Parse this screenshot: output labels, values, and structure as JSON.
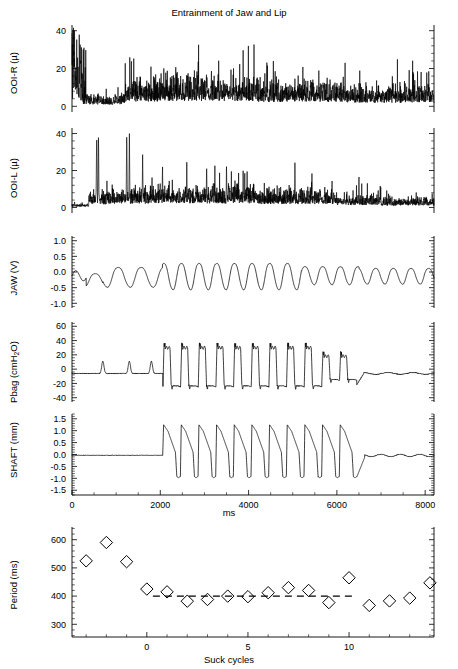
{
  "figure": {
    "title": "Entrainment of Jaw and Lip",
    "width": 458,
    "height": 669,
    "background": "#ffffff",
    "ink_color": "#000000"
  },
  "panels": [
    {
      "key": "ooi_r",
      "ylabel": "OOI-R (",
      "ylabel_unit": "µ",
      "ylabel_close": ")",
      "ylabel_full": "OOI-R (µ)",
      "yticks": [
        "0",
        "20",
        "40"
      ],
      "ytick_values": [
        0,
        20,
        40
      ],
      "ylim": [
        -3,
        43
      ],
      "xlim": [
        0,
        8200
      ]
    },
    {
      "key": "ooi_l",
      "ylabel_full": "OOI-L (µ)",
      "yticks": [
        "0",
        "20",
        "40"
      ],
      "ytick_values": [
        0,
        20,
        40
      ],
      "ylim": [
        -3,
        43
      ],
      "xlim": [
        0,
        8200
      ]
    },
    {
      "key": "jaw",
      "ylabel_full": "JAW (V)",
      "yticks": [
        "-1.0",
        "-0.5",
        "0.0",
        "0.5",
        "1.0"
      ],
      "ytick_values": [
        -1.0,
        -0.5,
        0.0,
        0.5,
        1.0
      ],
      "ylim": [
        -1.15,
        1.15
      ],
      "xlim": [
        0,
        8200
      ]
    },
    {
      "key": "pbag",
      "ylabel_full": "Pbag (cmH2O)",
      "ylabel_pre": "Pbag (cmH",
      "ylabel_sub": "2",
      "ylabel_post": "O)",
      "yticks": [
        "-40",
        "-20",
        "0",
        "20",
        "40",
        "60"
      ],
      "ytick_values": [
        -40,
        -20,
        0,
        20,
        40,
        60
      ],
      "ylim": [
        -46,
        66
      ],
      "xlim": [
        0,
        8200
      ]
    },
    {
      "key": "shaft",
      "ylabel_full": "SHAFT (mm)",
      "yticks": [
        "-1.5",
        "-1.0",
        "-0.5",
        "0.0",
        "0.5",
        "1.0",
        "1.5"
      ],
      "ytick_values": [
        -1.5,
        -1.0,
        -0.5,
        0.0,
        0.5,
        1.0,
        1.5
      ],
      "ylim": [
        -1.7,
        1.7
      ],
      "xlim": [
        0,
        8200
      ],
      "xlabel": "ms",
      "xticks": [
        "0",
        "2000",
        "4000",
        "6000",
        "8000"
      ],
      "xtick_values": [
        0,
        2000,
        4000,
        6000,
        8000
      ]
    },
    {
      "key": "period",
      "ylabel_full": "Period (ms)",
      "yticks": [
        "300",
        "400",
        "500",
        "600"
      ],
      "ytick_values": [
        300,
        400,
        500,
        600
      ],
      "ylim": [
        255,
        645
      ],
      "xlabel": "Suck cycles",
      "xticks": [
        "0",
        "5",
        "10"
      ],
      "xtick_values": [
        0,
        5,
        10
      ],
      "xlim": [
        -3.7,
        14.2
      ]
    }
  ],
  "chart_data": [
    {
      "type": "line",
      "name": "OOI-R",
      "title": "Entrainment of Jaw and Lip",
      "xlabel": "ms",
      "ylabel": "OOI-R (µ)",
      "xlim": [
        0,
        8200
      ],
      "ylim": [
        -3,
        43
      ],
      "yticks": [
        0,
        20,
        40
      ],
      "description": "Rectified EMG envelope of right orbicularis oris, noisy burst activity with large spikes to 40 at onset then sustained 5-25 activity",
      "grid": false
    },
    {
      "type": "line",
      "name": "OOI-L",
      "xlabel": "ms",
      "ylabel": "OOI-L (µ)",
      "xlim": [
        0,
        8200
      ],
      "ylim": [
        -3,
        43
      ],
      "yticks": [
        0,
        20,
        40
      ],
      "description": "Rectified EMG envelope of left orbicularis oris, spikes to 40 near 600 and 1300 ms then sustained noise 3-20",
      "grid": false
    },
    {
      "type": "line",
      "name": "JAW",
      "xlabel": "ms",
      "ylabel": "JAW (V)",
      "xlim": [
        0,
        8200
      ],
      "ylim": [
        -1.15,
        1.15
      ],
      "yticks": [
        -1.0,
        -0.5,
        0.0,
        0.5,
        1.0
      ],
      "description": "Quasi-sinusoidal jaw displacement oscillating between about -0.6 and +0.4 V, period shortening after 2000 ms",
      "grid": false
    },
    {
      "type": "line",
      "name": "Pbag",
      "xlabel": "ms",
      "ylabel": "Pbag (cmH2O)",
      "xlim": [
        0,
        8200
      ],
      "ylim": [
        -46,
        66
      ],
      "yticks": [
        -40,
        -20,
        0,
        20,
        40,
        60
      ],
      "description": "Bag pressure, small 10 cmH2O bumps before 2000 ms, then square pulses from -25 to +35 cmH2O until about 6400 ms",
      "grid": false
    },
    {
      "type": "line",
      "name": "SHAFT",
      "xlabel": "ms",
      "ylabel": "SHAFT (mm)",
      "xlim": [
        0,
        8200
      ],
      "ylim": [
        -1.7,
        1.7
      ],
      "yticks": [
        -1.5,
        -1.0,
        -0.5,
        0.0,
        0.5,
        1.0,
        1.5
      ],
      "xticks": [
        0,
        2000,
        4000,
        6000,
        8000
      ],
      "description": "Flat at 0 mm until 2050 ms, then sawtooth cycles rising to 1.25 and falling to -1.0 mm, ending at 6450 ms then returning to 0",
      "grid": false
    },
    {
      "type": "scatter",
      "name": "Period",
      "xlabel": "Suck cycles",
      "ylabel": "Period (ms)",
      "xlim": [
        -3.7,
        14.2
      ],
      "ylim": [
        255,
        645
      ],
      "xticks": [
        0,
        5,
        10
      ],
      "yticks": [
        300,
        400,
        500,
        600
      ],
      "marker": "diamond-open",
      "x": [
        -3,
        -2,
        -1,
        0,
        1,
        2,
        3,
        4,
        5,
        6,
        7,
        8,
        9,
        10,
        11,
        12,
        13,
        14
      ],
      "y": [
        525,
        590,
        522,
        425,
        415,
        382,
        388,
        400,
        398,
        412,
        430,
        420,
        377,
        465,
        367,
        383,
        393,
        447
      ],
      "reference_line": {
        "type": "dashed-horizontal",
        "y": 400,
        "x_start": 0.3,
        "x_end": 10.2,
        "label": "stimulus period 400 ms"
      },
      "grid": false
    }
  ]
}
